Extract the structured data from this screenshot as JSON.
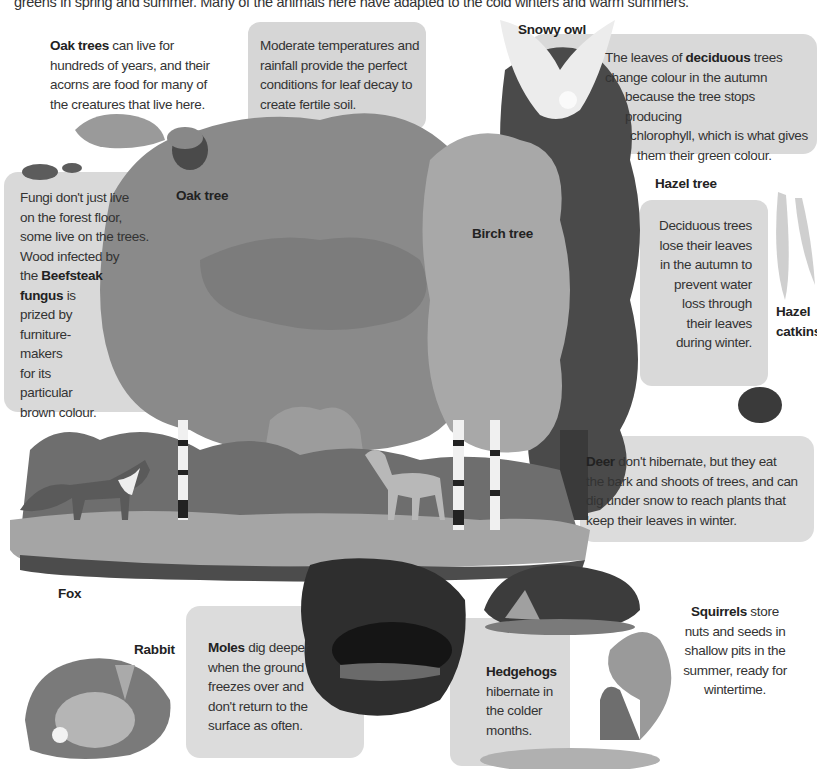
{
  "intro_text": "greens in spring and summer.  Many of the animals here have adapted to the cold winters and warm summers.",
  "labels": {
    "snowy_owl": "Snowy owl",
    "oak_tree": "Oak tree",
    "birch_tree": "Birch tree",
    "hazel_tree": "Hazel tree",
    "hazel_catkins_line1": "Hazel",
    "hazel_catkins_line2": "catkins",
    "fox": "Fox",
    "rabbit": "Rabbit"
  },
  "captions": {
    "oak": {
      "bold": "Oak trees",
      "lines": [
        " can live for",
        "hundreds of years, and their",
        "acorns are food for many of",
        "the creatures that live here."
      ]
    },
    "soil": {
      "lines": [
        "Moderate temperatures and",
        "rainfall provide the perfect",
        "conditions for leaf decay to",
        "create fertile soil."
      ]
    },
    "deciduous": {
      "pre": "The leaves of ",
      "bold": "deciduous",
      "post": " trees",
      "lines": [
        "change colour in the autumn",
        "because the tree stops producing",
        "chlorophyll, which is what gives",
        "them their green colour."
      ]
    },
    "fungi": {
      "lines": [
        "Fungi don't just live",
        "on the forest floor,",
        "some live on the trees.",
        "Wood infected by",
        "the "
      ],
      "bold1": "Beefsteak",
      "bold2": "fungus",
      "after_bold2": " is",
      "rest": [
        "prized by",
        "furniture-",
        "makers",
        "for its",
        "particular",
        "brown colour."
      ]
    },
    "lose_leaves": {
      "lines": [
        "Deciduous trees",
        "lose their leaves",
        "in the autumn to",
        "prevent water",
        "loss through",
        "their leaves",
        "during winter."
      ]
    },
    "deer": {
      "bold": "Deer",
      "lines": [
        " don't hibernate, but they eat",
        "the bark and shoots of trees, and can",
        "dig under snow to reach plants that",
        "keep their leaves in winter."
      ]
    },
    "moles": {
      "bold": "Moles",
      "lines": [
        " dig deeper",
        "when the ground",
        "freezes over and",
        "don't return to the",
        "surface as often."
      ]
    },
    "hedgehogs": {
      "bold": "Hedgehogs",
      "lines": [
        "hibernate in",
        "the colder",
        "months."
      ]
    },
    "squirrels": {
      "bold": "Squirrels",
      "lines": [
        " store",
        "nuts and seeds in",
        "shallow pits in the",
        "summer, ready for",
        "wintertime."
      ]
    }
  },
  "colors": {
    "box_gray": "#d9d9d9",
    "oak_canopy": "#8a8a8a",
    "birch_canopy": "#a8a8a8",
    "hazel_canopy": "#4a4a4a",
    "burrow": "#2e2e2e",
    "ground": "#9a9a9a"
  }
}
